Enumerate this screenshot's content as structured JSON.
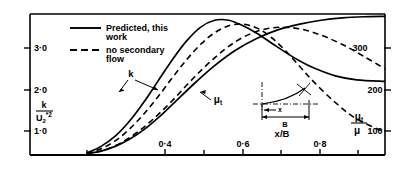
{
  "chart_data": {
    "type": "line",
    "title": "",
    "xlabel": "x/B",
    "ylabel_left": "k/U₂*²",
    "ylabel_right": "μₜ/μ",
    "xlim": [
      0.0,
      1.0
    ],
    "ylim_left": [
      0.0,
      3.6
    ],
    "ylim_right": [
      0,
      360
    ],
    "grid": false,
    "legend_position": "top-left",
    "xticks_labeled": [
      "0·4",
      "0·6",
      "0·8"
    ],
    "xticks_labeled_values": [
      0.4,
      0.6,
      0.8
    ],
    "xticks_minor_values": [
      0.3,
      0.5,
      0.7,
      0.9
    ],
    "yticks_left": [
      "1·0",
      "2·0",
      "3·0"
    ],
    "yticks_left_values": [
      1.0,
      2.0,
      3.0
    ],
    "yticks_right": [
      "100",
      "200",
      "300"
    ],
    "yticks_right_values": [
      100,
      200,
      300
    ],
    "legend": [
      {
        "label_line1": "Predicted, this",
        "label_line2": "work",
        "style": "solid"
      },
      {
        "label_line1": "no secondary",
        "label_line2": "flow",
        "style": "dashed"
      }
    ],
    "curve_labels": [
      {
        "name": "k",
        "text": "k"
      },
      {
        "name": "mu-t",
        "text": "μₜ"
      }
    ],
    "series": [
      {
        "name": "k-predicted",
        "label": "k",
        "axis": "left",
        "style": "solid",
        "x": [
          0.16,
          0.2,
          0.24,
          0.28,
          0.32,
          0.36,
          0.4,
          0.44,
          0.48,
          0.52,
          0.56,
          0.6,
          0.64,
          0.68,
          0.72,
          0.76,
          0.8,
          0.86,
          0.92,
          1.0
        ],
        "y": [
          0.05,
          0.22,
          0.48,
          0.86,
          1.34,
          1.88,
          2.42,
          2.9,
          3.26,
          3.44,
          3.44,
          3.3,
          3.1,
          2.86,
          2.62,
          2.4,
          2.22,
          2.02,
          1.92,
          1.88
        ]
      },
      {
        "name": "k-no-secondary-flow",
        "label": "k",
        "axis": "left",
        "style": "dashed",
        "x": [
          0.16,
          0.2,
          0.24,
          0.28,
          0.32,
          0.36,
          0.4,
          0.44,
          0.48,
          0.52,
          0.56,
          0.6,
          0.64,
          0.68,
          0.72,
          0.76,
          0.8,
          0.86,
          0.92,
          1.0
        ],
        "y": [
          0.04,
          0.16,
          0.36,
          0.66,
          1.04,
          1.48,
          1.96,
          2.42,
          2.82,
          3.12,
          3.3,
          3.34,
          3.24,
          3.0,
          2.66,
          2.26,
          1.86,
          1.34,
          0.92,
          0.58
        ]
      },
      {
        "name": "mu-t-predicted",
        "label": "μₜ",
        "axis": "right",
        "style": "solid",
        "x": [
          0.16,
          0.2,
          0.24,
          0.28,
          0.32,
          0.36,
          0.4,
          0.46,
          0.52,
          0.58,
          0.64,
          0.7,
          0.76,
          0.82,
          0.88,
          0.94,
          1.0
        ],
        "y": [
          4,
          10,
          22,
          40,
          64,
          94,
          128,
          180,
          228,
          268,
          298,
          320,
          334,
          344,
          350,
          353,
          354
        ]
      },
      {
        "name": "mu-t-no-secondary-flow",
        "label": "μₜ",
        "axis": "right",
        "style": "dashed",
        "x": [
          0.16,
          0.22,
          0.28,
          0.34,
          0.4,
          0.46,
          0.52,
          0.58,
          0.64,
          0.7,
          0.76,
          0.82,
          0.88,
          0.94,
          1.0
        ],
        "y": [
          3,
          16,
          44,
          86,
          138,
          196,
          248,
          290,
          316,
          326,
          322,
          306,
          282,
          252,
          220
        ]
      }
    ],
    "inset": {
      "name": "duct-cross-section",
      "label_x": "x",
      "label_B": "B"
    }
  }
}
